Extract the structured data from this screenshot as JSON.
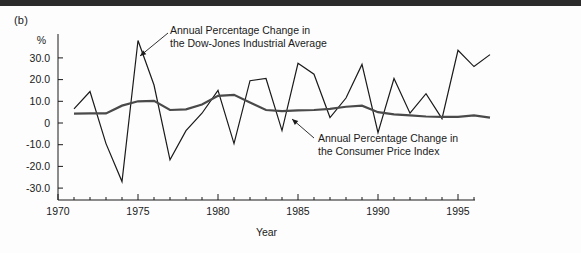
{
  "figure": {
    "panel_label": "(b)",
    "background_color": "#fdfdfd",
    "border_color": "#2b2b2b"
  },
  "chart_data": {
    "type": "line",
    "title": "",
    "subtitle": "",
    "xlabel": "Year",
    "ylabel": "%",
    "xlim": [
      1970,
      1998
    ],
    "ylim": [
      -35,
      40
    ],
    "xticks": [
      1970,
      1975,
      1980,
      1985,
      1990,
      1995
    ],
    "xtick_labels": [
      "1970",
      "1975",
      "1980",
      "1985",
      "1990",
      "1995"
    ],
    "xtick_minor_interval": 1,
    "yticks": [
      30,
      20,
      10,
      0,
      -10,
      -20,
      -30
    ],
    "ytick_labels": [
      "30.0",
      "20.0",
      "10.0",
      "0",
      "-10.0",
      "-20.0",
      "-30.0"
    ],
    "grid": false,
    "legend_position": "annotations",
    "series": [
      {
        "name": "Annual Percentage Change in the Dow-Jones Industrial Average",
        "short_name": "dow-jones",
        "color": "#1a1a1a",
        "line_width": 1.2,
        "x": [
          1971,
          1972,
          1973,
          1974,
          1975,
          1976,
          1977,
          1978,
          1979,
          1980,
          1981,
          1982,
          1983,
          1984,
          1985,
          1986,
          1987,
          1988,
          1989,
          1990,
          1991,
          1992,
          1993,
          1994,
          1995,
          1996,
          1997
        ],
        "values": [
          6.5,
          14.5,
          -9.5,
          -27.0,
          38.0,
          17.5,
          -17.0,
          -3.5,
          4.5,
          15.0,
          -9.5,
          19.5,
          20.5,
          -3.5,
          27.5,
          22.5,
          2.5,
          11.5,
          27.0,
          -4.5,
          20.5,
          4.5,
          13.5,
          2.0,
          33.5,
          26.0,
          31.5
        ]
      },
      {
        "name": "Annual Percentage Change in the Consumer Price Index",
        "short_name": "consumer-price-index",
        "color": "#4a4a4a",
        "line_width": 2.2,
        "x": [
          1971,
          1972,
          1973,
          1974,
          1975,
          1976,
          1977,
          1978,
          1979,
          1980,
          1981,
          1982,
          1983,
          1984,
          1985,
          1986,
          1987,
          1988,
          1989,
          1990,
          1991,
          1992,
          1993,
          1994,
          1995,
          1996,
          1997
        ],
        "values": [
          4.3,
          4.4,
          4.4,
          8.0,
          10.0,
          10.2,
          6.0,
          6.3,
          8.5,
          12.5,
          13.0,
          9.5,
          6.0,
          5.5,
          5.8,
          6.0,
          6.5,
          7.5,
          8.0,
          5.0,
          4.0,
          3.5,
          3.0,
          2.8,
          2.8,
          3.5,
          2.5
        ]
      }
    ],
    "annotations": [
      {
        "id": "dow-jones-annotation",
        "line1": "Annual Percentage Change in",
        "line2": "the Dow-Jones Industrial Average",
        "text_x": 170,
        "text_y": 34,
        "leader_from_x": 168,
        "leader_from_y": 33,
        "leader_to_x": 140,
        "leader_to_y": 56
      },
      {
        "id": "cpi-annotation",
        "line1": "Annual Percentage Change in",
        "line2": "the Consumer Price Index",
        "text_x": 318,
        "text_y": 142,
        "leader_from_x": 314,
        "leader_from_y": 138,
        "leader_to_x": 292,
        "leader_to_y": 119
      }
    ]
  }
}
